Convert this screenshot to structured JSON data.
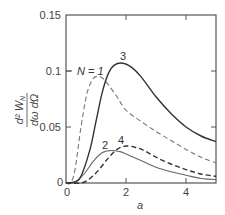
{
  "chart_data": {
    "type": "line",
    "title": "",
    "xlabel": "a",
    "ylabel": "d² W_N / dω dΩ",
    "ylabel_numerator": "d² W_N",
    "ylabel_denominator": "dω dΩ",
    "xlim": [
      0,
      5
    ],
    "ylim": [
      0,
      0.15
    ],
    "grid": false,
    "legend": "inline curve labels",
    "x_ticks": [
      0,
      2,
      4
    ],
    "x_tick_labels": [
      "0",
      "2",
      "4"
    ],
    "y_ticks": [
      0,
      0.05,
      0.1,
      0.15
    ],
    "y_tick_labels": [
      "0",
      "0.05",
      "0.1",
      "0.15"
    ],
    "series": [
      {
        "name": "N = 1",
        "label": "N = 1",
        "style": "dashed",
        "x": [
          0,
          0.15,
          0.3,
          0.5,
          0.7,
          0.9,
          1.05,
          1.2,
          1.4,
          1.7,
          2.0,
          2.5,
          3.0,
          3.5,
          4.0,
          4.5,
          5.0
        ],
        "values": [
          0,
          0,
          0.012,
          0.05,
          0.08,
          0.093,
          0.095,
          0.094,
          0.088,
          0.077,
          0.065,
          0.055,
          0.046,
          0.038,
          0.03,
          0.023,
          0.018
        ]
      },
      {
        "name": "N = 2",
        "label": "2",
        "style": "solid",
        "x": [
          0,
          0.3,
          0.6,
          0.9,
          1.2,
          1.5,
          1.8,
          2.0,
          2.5,
          3.0,
          3.5,
          4.0,
          4.5,
          5.0
        ],
        "values": [
          0,
          0.001,
          0.008,
          0.019,
          0.027,
          0.029,
          0.028,
          0.026,
          0.02,
          0.014,
          0.01,
          0.007,
          0.004,
          0.003
        ]
      },
      {
        "name": "N = 3",
        "label": "3",
        "style": "solid",
        "x": [
          0,
          0.3,
          0.5,
          0.8,
          1.0,
          1.2,
          1.4,
          1.6,
          1.9,
          2.2,
          2.5,
          3.0,
          3.5,
          4.0,
          4.5,
          5.0
        ],
        "values": [
          0,
          0.001,
          0.006,
          0.03,
          0.055,
          0.08,
          0.097,
          0.105,
          0.107,
          0.103,
          0.095,
          0.077,
          0.062,
          0.05,
          0.042,
          0.037
        ]
      },
      {
        "name": "N = 4",
        "label": "4",
        "style": "dashed",
        "x": [
          0,
          0.5,
          0.8,
          1.1,
          1.4,
          1.7,
          2.0,
          2.3,
          2.6,
          3.0,
          3.5,
          4.0,
          4.5,
          5.0
        ],
        "values": [
          0,
          0.0,
          0.004,
          0.012,
          0.022,
          0.03,
          0.033,
          0.032,
          0.029,
          0.023,
          0.017,
          0.012,
          0.008,
          0.006
        ]
      }
    ]
  },
  "labels": {
    "x_axis": "a",
    "y_num": "d² W",
    "y_sub": "N",
    "y_den": "dω dΩ",
    "curve_n1": "N = 1",
    "curve_2": "2",
    "curve_3": "3",
    "curve_4": "4",
    "y_tick_0": "0",
    "y_tick_005": "0.05",
    "y_tick_01": "0.1",
    "y_tick_015": "0.15",
    "x_tick_0": "0",
    "x_tick_2": "2",
    "x_tick_4": "4"
  }
}
